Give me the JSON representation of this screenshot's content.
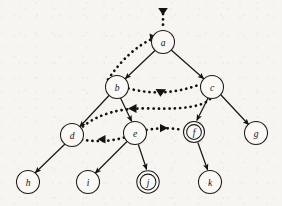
{
  "figure": {
    "type": "directed-graph",
    "background_color": "#f6f5f1",
    "ink_color": "#131313",
    "width": 282,
    "height": 206
  },
  "nodes": [
    {
      "id": "a",
      "label": "a",
      "cx": 163,
      "cy": 42,
      "r": 11.5,
      "double": false
    },
    {
      "id": "b",
      "label": "b",
      "cx": 117,
      "cy": 87,
      "r": 11.5,
      "double": false
    },
    {
      "id": "c",
      "label": "c",
      "cx": 212,
      "cy": 87,
      "r": 11.5,
      "double": false
    },
    {
      "id": "d",
      "label": "d",
      "cx": 72,
      "cy": 135,
      "r": 11.5,
      "double": false
    },
    {
      "id": "e",
      "label": "e",
      "cx": 135,
      "cy": 133,
      "r": 11.5,
      "double": false
    },
    {
      "id": "f",
      "label": "f",
      "cx": 194,
      "cy": 132,
      "r": 10.5,
      "double": true
    },
    {
      "id": "g",
      "label": "g",
      "cx": 256,
      "cy": 133,
      "r": 11.5,
      "double": false
    },
    {
      "id": "h",
      "label": "h",
      "cx": 28,
      "cy": 182,
      "r": 11.5,
      "double": false
    },
    {
      "id": "i",
      "label": "i",
      "cx": 88,
      "cy": 182,
      "r": 11.5,
      "double": false
    },
    {
      "id": "j",
      "label": "j",
      "cx": 148,
      "cy": 182,
      "r": 10.5,
      "double": true
    },
    {
      "id": "k",
      "label": "k",
      "cx": 210,
      "cy": 182,
      "r": 11.5,
      "double": false
    }
  ],
  "entry_arrow": {
    "name": "root-entry-arrow",
    "from_x": 163,
    "from_y": 10,
    "to_x": 163,
    "to_y": 30,
    "style": "dotted"
  },
  "tree_edges": [
    {
      "from": "a",
      "to": "b",
      "style": "solid"
    },
    {
      "from": "a",
      "to": "c",
      "style": "solid"
    },
    {
      "from": "b",
      "to": "d",
      "style": "solid"
    },
    {
      "from": "b",
      "to": "e",
      "style": "solid"
    },
    {
      "from": "c",
      "to": "f",
      "style": "solid"
    },
    {
      "from": "c",
      "to": "g",
      "style": "solid"
    },
    {
      "from": "d",
      "to": "h",
      "style": "solid"
    },
    {
      "from": "e",
      "to": "i",
      "style": "solid"
    },
    {
      "from": "e",
      "to": "j",
      "style": "solid"
    },
    {
      "from": "f",
      "to": "k",
      "style": "solid"
    }
  ],
  "dotted_edges": [
    {
      "from": "b",
      "to": "c",
      "style": "dotted",
      "note": "upper curve, arrow toward c"
    },
    {
      "from": "c",
      "to": "d",
      "style": "dotted",
      "note": "long curve under b, arrow toward d"
    },
    {
      "from": "e",
      "to": "d",
      "style": "dotted",
      "note": "short curve, arrow toward d"
    },
    {
      "from": "e",
      "to": "f",
      "style": "dotted",
      "note": "short curve, arrow toward f"
    },
    {
      "from": "b",
      "to": "a",
      "style": "dotted",
      "note": "left curve, arrow toward a"
    }
  ],
  "legend": {
    "solid_meaning": "tree edge",
    "dotted_meaning": "non-tree edge",
    "double_circle_meaning": "marked node"
  }
}
